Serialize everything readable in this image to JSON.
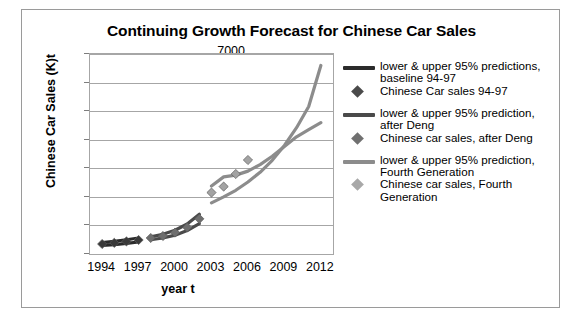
{
  "chart_data": {
    "type": "line",
    "title": "Continuing Growth Forecast for Chinese Car Sales",
    "xlabel": "year t",
    "ylabel": "Chinese Car Sales (K)t",
    "xlim": [
      1993,
      2013
    ],
    "ylim": [
      0,
      7000
    ],
    "grid": true,
    "legend_position": "right",
    "xticks": [
      "1994",
      "1997",
      "2000",
      "2003",
      "2006",
      "2009",
      "2012"
    ],
    "xtick_values": [
      1994,
      1997,
      2000,
      2003,
      2006,
      2009,
      2012
    ],
    "yticks": [
      "0",
      "1000",
      "2000",
      "3000",
      "4000",
      "5000",
      "6000",
      "7000"
    ],
    "ytick_values": [
      0,
      1000,
      2000,
      3000,
      4000,
      5000,
      6000,
      7000
    ],
    "series": [
      {
        "name": "lower & upper 95% predictions, baseline 94-97",
        "kind": "band",
        "color": "#2b2b2b",
        "x": [
          1994,
          1995,
          1996,
          1997
        ],
        "lower": [
          300,
          330,
          370,
          420
        ],
        "upper": [
          400,
          445,
          500,
          560
        ]
      },
      {
        "name": "Chinese Car sales 94-97",
        "kind": "markers",
        "color": "#3a3a3a",
        "x": [
          1994,
          1995,
          1996,
          1997
        ],
        "values": [
          350,
          390,
          440,
          490
        ]
      },
      {
        "name": "lower & upper 95% prediction, after Deng",
        "kind": "band",
        "color": "#4a4a4a",
        "x": [
          1998,
          1999,
          2000,
          2001,
          2002
        ],
        "lower": [
          500,
          560,
          660,
          820,
          1060
        ],
        "upper": [
          600,
          690,
          830,
          1050,
          1390
        ]
      },
      {
        "name": "Chinese car sales, after Deng",
        "kind": "markers",
        "color": "#6e6e6e",
        "x": [
          1998,
          1999,
          2000,
          2001,
          2002
        ],
        "values": [
          560,
          630,
          750,
          930,
          1230
        ]
      },
      {
        "name": "lower & upper 95% prediction, Fourth Generation",
        "kind": "band",
        "color": "#8c8c8c",
        "x": [
          2003,
          2004,
          2005,
          2006,
          2007,
          2008,
          2009,
          2010,
          2011,
          2012
        ],
        "lower": [
          1790,
          2000,
          2230,
          2520,
          2860,
          3280,
          3800,
          4420,
          5160,
          6600
        ],
        "upper": [
          2380,
          2700,
          2760,
          2900,
          3130,
          3420,
          3760,
          4100,
          4350,
          4600
        ]
      },
      {
        "name": "Chinese car sales, Fourth Generation",
        "kind": "markers",
        "color": "#a3a3a3",
        "x": [
          2003,
          2004,
          2005,
          2006
        ],
        "values": [
          2150,
          2360,
          2800,
          3290
        ]
      }
    ]
  },
  "legend": {
    "entries": [
      {
        "swatch": "line",
        "color": "#2b2b2b",
        "label": "lower & upper 95% predictions, baseline 94-97"
      },
      {
        "swatch": "marker",
        "color": "#4a4a4a",
        "label": "Chinese Car sales 94-97"
      },
      {
        "swatch": "line",
        "color": "#4a4a4a",
        "label": "lower & upper 95% prediction, after Deng"
      },
      {
        "swatch": "marker",
        "color": "#707070",
        "label": "Chinese car sales, after Deng"
      },
      {
        "swatch": "line",
        "color": "#8c8c8c",
        "label": "lower & upper 95% prediction, Fourth Generation"
      },
      {
        "swatch": "marker",
        "color": "#a8a8a8",
        "label": "Chinese car sales, Fourth Generation"
      }
    ]
  }
}
